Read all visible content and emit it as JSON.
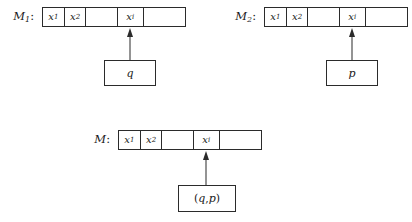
{
  "figure": {
    "symbols": {
      "x1_var": "x",
      "x1_sub": "1",
      "x2_var": "x",
      "x2_sub": "2",
      "xi_var": "x",
      "xi_sub": "i",
      "blank": ""
    },
    "machines": [
      {
        "id": "m1",
        "name_var": "M",
        "name_sub": "1",
        "name_colon": ":",
        "state": "q",
        "cells": [
          {
            "var": "x",
            "sub": "1"
          },
          {
            "var": "x",
            "sub": "2"
          },
          {
            "var": "",
            "sub": ""
          },
          {
            "var": "x",
            "sub": "i"
          },
          {
            "var": "",
            "sub": ""
          }
        ]
      },
      {
        "id": "m2",
        "name_var": "M",
        "name_sub": "2",
        "name_colon": ":",
        "state": "p",
        "cells": [
          {
            "var": "x",
            "sub": "1"
          },
          {
            "var": "x",
            "sub": "2"
          },
          {
            "var": "",
            "sub": ""
          },
          {
            "var": "x",
            "sub": "i"
          },
          {
            "var": "",
            "sub": ""
          }
        ]
      },
      {
        "id": "m",
        "name_var": "M",
        "name_sub": "",
        "name_colon": ":",
        "state_open": "(",
        "state_left": "q",
        "state_comma": ",",
        "state_right": "p",
        "state_close": ")",
        "cells": [
          {
            "var": "x",
            "sub": "1"
          },
          {
            "var": "x",
            "sub": "2"
          },
          {
            "var": "",
            "sub": ""
          },
          {
            "var": "x",
            "sub": "i"
          },
          {
            "var": "",
            "sub": ""
          }
        ]
      }
    ],
    "colors": {
      "ink": "#2b2b2b",
      "background": "#ffffff"
    }
  }
}
